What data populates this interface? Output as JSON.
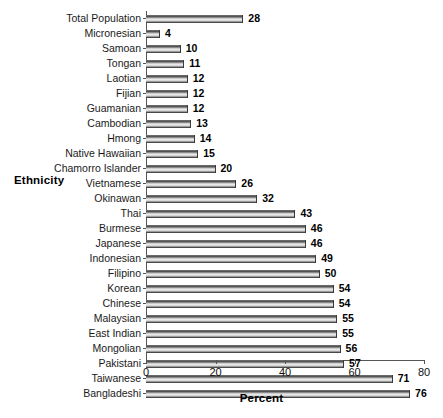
{
  "chart_data": {
    "type": "bar",
    "orientation": "horizontal",
    "title": "",
    "xlabel": "Percent",
    "ylabel": "Ethnicity",
    "xlim": [
      0,
      80
    ],
    "xticks": [
      0,
      20,
      40,
      60,
      80
    ],
    "grid": false,
    "legend": null,
    "categories": [
      "Total Population",
      "Micronesian",
      "Samoan",
      "Tongan",
      "Laotian",
      "Fijian",
      "Guamanian",
      "Cambodian",
      "Hmong",
      "Native Hawaiian",
      "Chamorro Islander",
      "Vietnamese",
      "Okinawan",
      "Thai",
      "Burmese",
      "Japanese",
      "Indonesian",
      "Filipino",
      "Korean",
      "Chinese",
      "Malaysian",
      "East Indian",
      "Mongolian",
      "Pakistani",
      "Taiwanese",
      "Bangladeshi"
    ],
    "values": [
      28,
      4,
      10,
      11,
      12,
      12,
      12,
      13,
      14,
      15,
      20,
      26,
      32,
      43,
      46,
      46,
      49,
      50,
      54,
      54,
      55,
      55,
      56,
      57,
      71,
      76
    ],
    "value_labels": [
      "28",
      "4",
      "10",
      "11",
      "12",
      "12",
      "12",
      "13",
      "14",
      "15",
      "20",
      "26",
      "32",
      "43",
      "46",
      "46",
      "49",
      "50",
      "54",
      "54",
      "55",
      "55",
      "56",
      "57",
      "71",
      "76"
    ],
    "xtick_labels": [
      "0",
      "20",
      "40",
      "60",
      "80"
    ],
    "bar_color": "#8a8a8a",
    "axis_color": "#555555",
    "text_color": "#1a1a1a",
    "background": "#ffffff"
  }
}
